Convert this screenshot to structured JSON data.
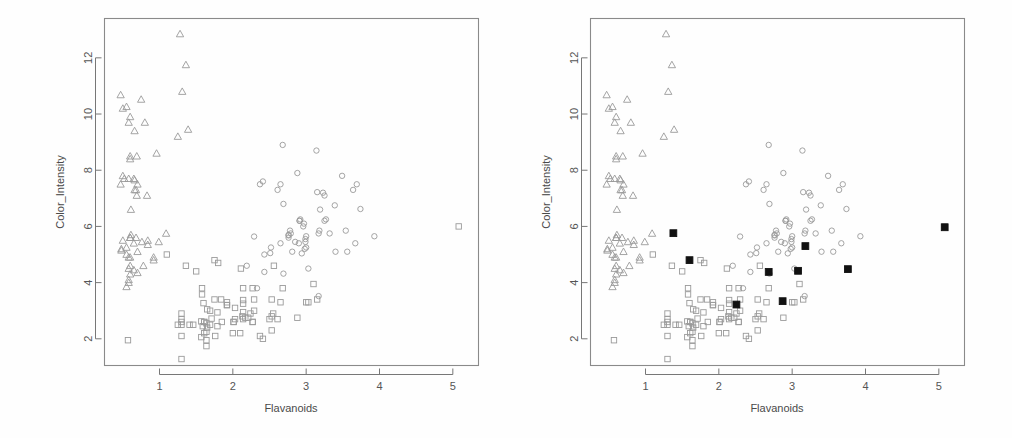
{
  "figure": {
    "background_color": "#ffffff",
    "panel_count": 2,
    "frame_color": "#8a8a8a",
    "marker_stroke_color": "#9a9a9a",
    "highlight_color": "#111111"
  },
  "panels": [
    {
      "id": "left",
      "name": "scatter-panel-left",
      "highlights_shown": false
    },
    {
      "id": "right",
      "name": "scatter-panel-right",
      "highlights_shown": true
    }
  ],
  "chart_data": {
    "type": "scatter",
    "title": "",
    "xlabel": "Flavanoids",
    "ylabel": "Color_Intensity",
    "xlim": [
      0.25,
      5.35
    ],
    "ylim": [
      1.05,
      13.4
    ],
    "xticks": [
      1,
      2,
      3,
      4,
      5
    ],
    "yticks": [
      2,
      4,
      6,
      8,
      10,
      12
    ],
    "xtick_labels": [
      "1",
      "2",
      "3",
      "4",
      "5"
    ],
    "ytick_labels": [
      "2",
      "4",
      "6",
      "8",
      "10",
      "12"
    ],
    "grid": false,
    "legend": "none",
    "series": [
      {
        "name": "class-1",
        "marker": "circle",
        "filled": false,
        "x": [
          2.29,
          2.43,
          2.76,
          3.49,
          2.69,
          3.39,
          2.52,
          2.51,
          2.98,
          3.15,
          3.32,
          2.43,
          2.76,
          3.69,
          3.64,
          2.91,
          3.14,
          3.4,
          3.93,
          3.03,
          3.17,
          2.41,
          2.88,
          2.37,
          2.61,
          2.68,
          2.94,
          2.19,
          2.97,
          2.33,
          3.25,
          3.19,
          2.69,
          3.56,
          3.0,
          2.65,
          2.76,
          3.23,
          3.67,
          3.25,
          3.17,
          3.0,
          2.92,
          3.54,
          3.27,
          2.99,
          3.74,
          2.79,
          2.9,
          2.78,
          2.85,
          2.99,
          3.18,
          2.81,
          2.96,
          2.65,
          2.91
        ],
        "y": [
          5.64,
          4.38,
          5.68,
          7.8,
          4.32,
          6.75,
          5.25,
          5.05,
          5.2,
          7.22,
          5.75,
          5.0,
          5.6,
          7.5,
          7.3,
          6.2,
          8.7,
          5.1,
          5.65,
          4.5,
          3.52,
          7.6,
          7.9,
          7.5,
          7.3,
          8.9,
          5.04,
          4.6,
          6.1,
          3.8,
          6.2,
          6.6,
          6.8,
          5.1,
          5.65,
          7.5,
          5.7,
          7.2,
          5.4,
          7.1,
          5.75,
          5.25,
          6.25,
          5.85,
          6.25,
          5.45,
          6.62,
          5.75,
          5.4,
          5.85,
          5.45,
          5.55,
          5.85,
          5.1,
          6.0,
          5.4,
          6.2
        ]
      },
      {
        "name": "class-2",
        "marker": "square",
        "filled": false,
        "x": [
          1.1,
          1.75,
          2.65,
          2.0,
          1.85,
          2.55,
          1.46,
          1.61,
          2.03,
          1.64,
          1.92,
          1.84,
          2.03,
          1.76,
          2.68,
          2.14,
          2.53,
          1.79,
          2.14,
          1.69,
          2.01,
          2.29,
          2.17,
          1.64,
          1.92,
          2.14,
          1.6,
          2.24,
          1.57,
          1.59,
          1.65,
          1.25,
          2.27,
          2.53,
          1.3,
          2.14,
          1.3,
          2.27,
          3.15,
          2.13,
          1.64,
          1.57,
          1.61,
          1.69,
          1.58,
          1.65,
          1.79,
          2.56,
          2.14,
          1.5,
          1.3,
          2.27,
          1.61,
          1.58,
          1.92,
          1.64,
          2.29,
          2.1,
          2.5,
          3.1,
          2.21,
          1.75,
          1.3,
          1.3,
          2.01,
          3.0,
          3.03,
          2.41,
          2.88,
          2.37,
          2.61,
          5.08,
          0.57,
          1.41,
          1.36,
          1.3,
          1.8,
          2.11,
          2.53,
          1.71
        ],
        "y": [
          5.0,
          3.4,
          3.3,
          2.2,
          2.6,
          2.9,
          2.5,
          2.2,
          3.1,
          2.25,
          3.2,
          3.4,
          2.7,
          2.1,
          3.8,
          2.95,
          2.8,
          2.45,
          3.25,
          2.5,
          2.6,
          3.0,
          2.75,
          2.55,
          3.3,
          2.7,
          3.27,
          2.9,
          2.62,
          2.45,
          3.05,
          2.5,
          3.8,
          3.4,
          2.9,
          3.38,
          2.5,
          2.6,
          3.4,
          2.8,
          1.95,
          2.06,
          2.6,
          3.0,
          3.58,
          2.4,
          2.94,
          4.6,
          3.8,
          4.4,
          1.28,
          2.6,
          2.6,
          3.8,
          3.2,
          1.74,
          3.4,
          2.2,
          2.7,
          3.95,
          2.75,
          4.8,
          2.7,
          2.6,
          2.6,
          3.3,
          3.3,
          2.0,
          2.75,
          2.1,
          2.7,
          6.0,
          1.95,
          2.5,
          4.6,
          2.1,
          4.7,
          4.5,
          2.3,
          2.72
        ]
      },
      {
        "name": "class-3",
        "marker": "triangle",
        "filled": false,
        "x": [
          0.6,
          0.47,
          0.68,
          0.58,
          0.5,
          0.52,
          0.8,
          0.7,
          0.66,
          0.6,
          0.5,
          0.47,
          0.55,
          0.58,
          0.65,
          0.66,
          0.6,
          0.75,
          0.69,
          0.68,
          0.76,
          0.84,
          0.92,
          0.61,
          0.92,
          0.5,
          0.6,
          0.65,
          0.58,
          0.6,
          0.78,
          0.55,
          0.84,
          0.58,
          0.55,
          0.69,
          0.65,
          0.48,
          0.61,
          0.58,
          0.7,
          0.66,
          0.7,
          0.55,
          0.6,
          0.48,
          0.6,
          1.25,
          1.28,
          1.36,
          1.31,
          0.83,
          0.96,
          1.09,
          1.39,
          0.99,
          0.58,
          0.6
        ],
        "y": [
          5.6,
          7.5,
          7.3,
          7.7,
          7.8,
          7.7,
          9.7,
          7.5,
          9.4,
          9.9,
          10.2,
          10.68,
          10.26,
          9.7,
          7.7,
          7.3,
          8.4,
          10.52,
          8.5,
          5.6,
          5.45,
          5.35,
          4.9,
          5.7,
          4.8,
          5.5,
          5.6,
          4.45,
          4.1,
          4.9,
          4.6,
          3.85,
          5.5,
          4.0,
          5.0,
          7.1,
          5.4,
          5.2,
          6.6,
          4.9,
          4.35,
          7.65,
          5.1,
          5.25,
          8.5,
          5.15,
          4.6,
          9.2,
          12.85,
          11.75,
          10.8,
          7.1,
          8.6,
          5.75,
          9.45,
          5.45,
          4.5,
          4.3
        ]
      }
    ],
    "highlights": {
      "name": "selected-points",
      "marker": "square",
      "filled": true,
      "color": "#111111",
      "x": [
        1.38,
        1.6,
        2.24,
        2.68,
        2.87,
        3.08,
        3.18,
        3.76,
        5.08
      ],
      "y": [
        5.76,
        4.8,
        3.22,
        4.38,
        3.34,
        4.42,
        5.3,
        4.48,
        5.97
      ]
    }
  }
}
